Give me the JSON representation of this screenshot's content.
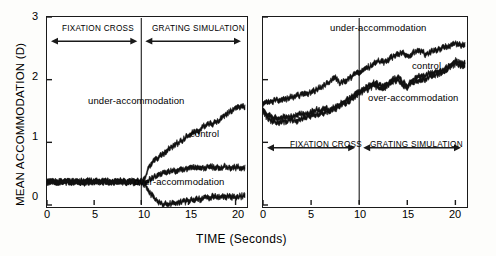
{
  "figure": {
    "axis_y_title": "MEAN ACCOMMODATION (D)",
    "axis_x_title": "TIME (Seconds)"
  },
  "chart_data": {
    "type": "line",
    "title": "",
    "xlabel": "TIME (Seconds)",
    "ylabel": "MEAN ACCOMMODATION (D)",
    "xlim": [
      0,
      21
    ],
    "ylim": [
      0,
      3
    ],
    "xticks": [
      "0",
      "5",
      "10",
      "15",
      "20"
    ],
    "xtick_values": [
      0,
      5,
      10,
      15,
      20
    ],
    "yticks": [
      "0",
      "1",
      "2",
      "3"
    ],
    "ytick_values": [
      0,
      1,
      2,
      3
    ],
    "grid": false,
    "legend_position": "inline-annotations",
    "panels": [
      {
        "name": "left-panel",
        "y_axis_labeled": true,
        "phase_divider_x": 10,
        "annotations": [
          {
            "text": "FIXATION CROSS",
            "x_range": [
              0,
              10
            ],
            "y": 2.55
          },
          {
            "text": "GRATING SIMULATION",
            "x_range": [
              10,
              21
            ],
            "y": 2.55
          },
          {
            "text": "under-accommodation",
            "x": 5.0,
            "y": 1.45
          },
          {
            "text": "control",
            "x": 15.8,
            "y": 0.88
          },
          {
            "text": "over-accommodation",
            "x": 10.2,
            "y": -0.18
          }
        ],
        "series": [
          {
            "name": "under-accommodation",
            "x": [
              0,
              0.5,
              1,
              1.5,
              2,
              2.5,
              3,
              3.5,
              4,
              4.5,
              5,
              5.5,
              6,
              6.5,
              7,
              7.5,
              8,
              8.5,
              9,
              9.5,
              10,
              10.3,
              10.6,
              11,
              11.5,
              12,
              12.5,
              13,
              13.5,
              14,
              14.5,
              15,
              15.5,
              16,
              16.5,
              17,
              17.5,
              18,
              18.5,
              19,
              19.5,
              20,
              20.5
            ],
            "values": [
              0.36,
              0.37,
              0.38,
              0.36,
              0.39,
              0.37,
              0.38,
              0.36,
              0.37,
              0.39,
              0.38,
              0.36,
              0.38,
              0.37,
              0.39,
              0.37,
              0.38,
              0.36,
              0.38,
              0.37,
              0.38,
              0.42,
              0.52,
              0.66,
              0.72,
              0.78,
              0.84,
              0.9,
              0.95,
              1.0,
              1.05,
              1.12,
              1.15,
              1.18,
              1.25,
              1.3,
              1.28,
              1.33,
              1.38,
              1.45,
              1.5,
              1.54,
              1.56
            ]
          },
          {
            "name": "control",
            "x": [
              0,
              0.5,
              1,
              1.5,
              2,
              2.5,
              3,
              3.5,
              4,
              4.5,
              5,
              5.5,
              6,
              6.5,
              7,
              7.5,
              8,
              8.5,
              9,
              9.5,
              10,
              10.3,
              10.6,
              11,
              11.5,
              12,
              12.5,
              13,
              13.5,
              14,
              14.5,
              15,
              15.5,
              16,
              16.5,
              17,
              17.5,
              18,
              18.5,
              19,
              19.5,
              20,
              20.5
            ],
            "values": [
              0.36,
              0.37,
              0.36,
              0.38,
              0.37,
              0.36,
              0.38,
              0.37,
              0.36,
              0.38,
              0.37,
              0.36,
              0.38,
              0.37,
              0.36,
              0.37,
              0.38,
              0.36,
              0.37,
              0.36,
              0.36,
              0.36,
              0.38,
              0.42,
              0.46,
              0.49,
              0.52,
              0.54,
              0.55,
              0.56,
              0.57,
              0.58,
              0.59,
              0.6,
              0.59,
              0.6,
              0.61,
              0.6,
              0.6,
              0.61,
              0.6,
              0.6,
              0.6
            ]
          },
          {
            "name": "over-accommodation",
            "x": [
              0,
              0.5,
              1,
              1.5,
              2,
              2.5,
              3,
              3.5,
              4,
              4.5,
              5,
              5.5,
              6,
              6.5,
              7,
              7.5,
              8,
              8.5,
              9,
              9.5,
              10,
              10.3,
              10.6,
              11,
              11.5,
              12,
              12.5,
              13,
              13.5,
              14,
              14.5,
              15,
              15.5,
              16,
              16.5,
              17,
              17.5,
              18,
              18.5,
              19,
              19.5,
              20,
              20.5
            ],
            "values": [
              0.36,
              0.37,
              0.38,
              0.36,
              0.37,
              0.38,
              0.36,
              0.37,
              0.38,
              0.36,
              0.37,
              0.38,
              0.36,
              0.37,
              0.36,
              0.38,
              0.37,
              0.36,
              0.38,
              0.37,
              0.36,
              0.34,
              0.28,
              0.18,
              0.08,
              0.03,
              0.01,
              0.02,
              0.03,
              0.04,
              0.05,
              0.07,
              0.08,
              0.09,
              0.1,
              0.12,
              0.13,
              0.13,
              0.14,
              0.14,
              0.13,
              0.14,
              0.14
            ]
          }
        ]
      },
      {
        "name": "right-panel",
        "y_axis_labeled": false,
        "phase_divider_x": 10,
        "annotations": [
          {
            "text": "under-accommodation",
            "x": 7.2,
            "y": 2.72
          },
          {
            "text": "control",
            "x": 14.5,
            "y": 2.15
          },
          {
            "text": "over-accommodation",
            "x": 9.2,
            "y": 1.55
          },
          {
            "text": "FIXATION CROSS",
            "x_range": [
              0,
              10
            ],
            "y": 0.85
          },
          {
            "text": "GRATING SIMULATION",
            "x_range": [
              10,
              21
            ],
            "y": 0.85
          }
        ],
        "series": [
          {
            "name": "under-accommodation",
            "x": [
              0,
              0.5,
              1,
              1.5,
              2,
              2.5,
              3,
              3.5,
              4,
              4.5,
              5,
              5.5,
              6,
              6.5,
              7,
              7.5,
              8,
              8.5,
              9,
              9.5,
              10,
              10.5,
              11,
              11.5,
              12,
              12.5,
              13,
              13.5,
              14,
              14.5,
              15,
              15.5,
              16,
              16.5,
              17,
              17.5,
              18,
              18.5,
              19,
              19.5,
              20,
              20.5
            ],
            "values": [
              1.62,
              1.64,
              1.66,
              1.68,
              1.67,
              1.7,
              1.72,
              1.74,
              1.76,
              1.78,
              1.8,
              1.84,
              1.88,
              1.92,
              1.98,
              2.04,
              1.95,
              1.98,
              2.02,
              2.08,
              2.12,
              2.16,
              2.2,
              2.26,
              2.3,
              2.28,
              2.32,
              2.36,
              2.4,
              2.44,
              2.38,
              2.42,
              2.46,
              2.44,
              2.4,
              2.44,
              2.48,
              2.5,
              2.52,
              2.55,
              2.58,
              2.56
            ]
          },
          {
            "name": "control",
            "x": [
              0,
              0.5,
              1,
              1.5,
              2,
              2.5,
              3,
              3.5,
              4,
              4.5,
              5,
              5.5,
              6,
              6.5,
              7,
              7.5,
              8,
              8.5,
              9,
              9.5,
              10,
              10.5,
              11,
              11.5,
              12,
              12.5,
              13,
              13.5,
              14,
              14.5,
              15,
              15.5,
              16,
              16.5,
              17,
              17.5,
              18,
              18.5,
              19,
              19.5,
              20,
              20.5
            ],
            "values": [
              1.52,
              1.44,
              1.4,
              1.38,
              1.4,
              1.42,
              1.41,
              1.43,
              1.45,
              1.44,
              1.48,
              1.52,
              1.5,
              1.54,
              1.52,
              1.56,
              1.6,
              1.66,
              1.7,
              1.76,
              1.8,
              1.86,
              1.9,
              1.96,
              1.92,
              1.88,
              1.94,
              2.0,
              2.04,
              1.96,
              1.9,
              1.98,
              2.04,
              2.06,
              2.08,
              2.1,
              2.12,
              2.14,
              2.18,
              2.24,
              2.3,
              2.26
            ]
          },
          {
            "name": "over-accommodation",
            "x": [
              0,
              0.5,
              1,
              1.5,
              2,
              2.5,
              3,
              3.5,
              4,
              4.5,
              5,
              5.5,
              6,
              6.5,
              7,
              7.5,
              8,
              8.5,
              9,
              9.5,
              10,
              10.5,
              11,
              11.5,
              12,
              12.5,
              13,
              13.5,
              14,
              14.5,
              15,
              15.5,
              16,
              16.5,
              17,
              17.5,
              18,
              18.5,
              19,
              19.5,
              20,
              20.5
            ],
            "values": [
              1.5,
              1.38,
              1.34,
              1.32,
              1.34,
              1.33,
              1.36,
              1.35,
              1.38,
              1.4,
              1.42,
              1.44,
              1.46,
              1.48,
              1.5,
              1.54,
              1.58,
              1.62,
              1.66,
              1.72,
              1.78,
              1.82,
              1.86,
              1.9,
              1.88,
              1.84,
              1.9,
              1.96,
              2.0,
              1.92,
              1.88,
              1.94,
              1.98,
              2.0,
              2.02,
              2.06,
              2.08,
              2.1,
              2.14,
              2.2,
              2.26,
              2.22
            ]
          }
        ]
      }
    ]
  }
}
